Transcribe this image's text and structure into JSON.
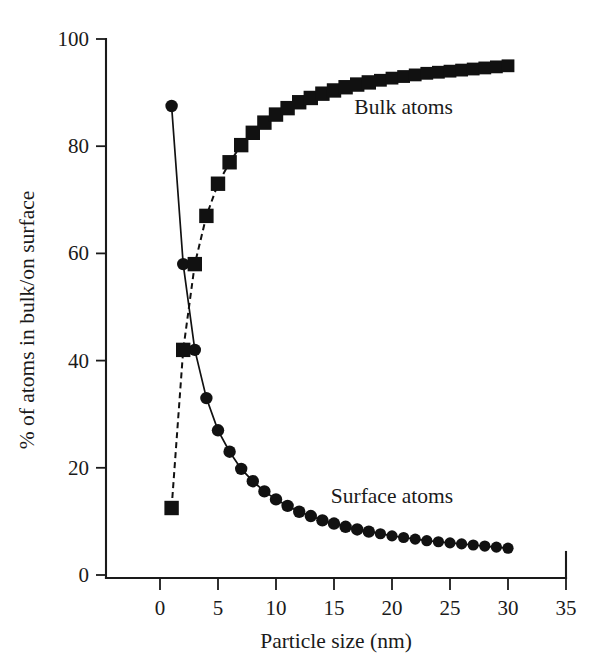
{
  "chart_data": {
    "type": "line",
    "title": "",
    "xlabel": "Particle size (nm)",
    "ylabel": "% of atoms in bulk/on surface",
    "xlim": [
      0,
      35
    ],
    "ylim": [
      0,
      100
    ],
    "xticks": [
      0,
      5,
      10,
      15,
      20,
      25,
      30,
      35
    ],
    "yticks": [
      0,
      20,
      40,
      60,
      80,
      100
    ],
    "grid": false,
    "legend_position": "inline-annotation",
    "x": [
      1,
      2,
      3,
      4,
      5,
      6,
      7,
      8,
      9,
      10,
      11,
      12,
      13,
      14,
      15,
      16,
      17,
      18,
      19,
      20,
      21,
      22,
      23,
      24,
      25,
      26,
      27,
      28,
      29,
      30
    ],
    "series": [
      {
        "name": "Surface atoms",
        "marker": "circle",
        "line": "solid",
        "color": "#111111",
        "values": [
          87.5,
          58.0,
          42.0,
          33.0,
          27.0,
          23.0,
          19.8,
          17.5,
          15.6,
          14.1,
          12.9,
          11.8,
          11.0,
          10.2,
          9.6,
          9.0,
          8.5,
          8.1,
          7.7,
          7.3,
          7.0,
          6.7,
          6.4,
          6.2,
          6.0,
          5.8,
          5.6,
          5.4,
          5.2,
          5.0
        ]
      },
      {
        "name": "Bulk atoms",
        "marker": "square",
        "line": "dashed",
        "color": "#111111",
        "values": [
          12.5,
          42.0,
          58.0,
          67.0,
          73.0,
          77.0,
          80.2,
          82.5,
          84.4,
          85.9,
          87.1,
          88.2,
          89.0,
          89.8,
          90.4,
          91.0,
          91.5,
          91.9,
          92.3,
          92.7,
          93.0,
          93.3,
          93.6,
          93.8,
          94.0,
          94.2,
          94.4,
          94.6,
          94.8,
          95.0
        ]
      }
    ],
    "annotations": [
      {
        "text": "Bulk atoms",
        "x": 21.0,
        "y": 86.0
      },
      {
        "text": "Surface atoms",
        "x": 20.0,
        "y": 13.5
      }
    ]
  },
  "axes": {
    "x_title": "Particle size (nm)",
    "y_title": "% of atoms in bulk/on surface",
    "x_tick_labels": [
      "0",
      "5",
      "10",
      "15",
      "20",
      "25",
      "30",
      "35"
    ],
    "y_tick_labels": [
      "0",
      "20",
      "40",
      "60",
      "80",
      "100"
    ]
  },
  "labels": {
    "bulk": "Bulk atoms",
    "surface": "Surface atoms"
  },
  "colors": {
    "ink": "#111111",
    "background": "#ffffff"
  }
}
